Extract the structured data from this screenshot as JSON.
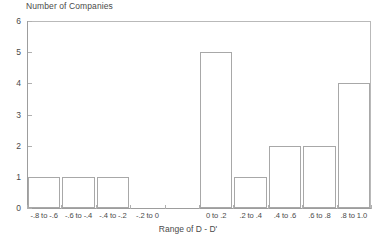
{
  "chart_data": {
    "type": "bar",
    "title": "Number of Companies",
    "xlabel": "Range of D - D'",
    "ylabel": "",
    "categories": [
      "-.8 to -.6",
      "-.6 to -.4",
      "-.4 to -.2",
      "-.2 to 0",
      "0 to .2",
      ".2 to .4",
      ".4 to .6",
      ".6 to .8",
      ".8 to 1.0"
    ],
    "values": [
      1,
      1,
      1,
      0,
      5,
      1,
      2,
      2,
      4
    ],
    "ylim": [
      0,
      6
    ],
    "yticks": [
      "0",
      "1",
      "2",
      "3",
      "4",
      "5",
      "6"
    ],
    "grid": false,
    "legend": "none",
    "bar_style": "outlined",
    "colors": {
      "bar_outline": "#a8a8a8",
      "bar_fill": "transparent",
      "axis": "#9d9d9d",
      "frame": "#b9b9b9",
      "text": "#4a4a4a"
    }
  }
}
